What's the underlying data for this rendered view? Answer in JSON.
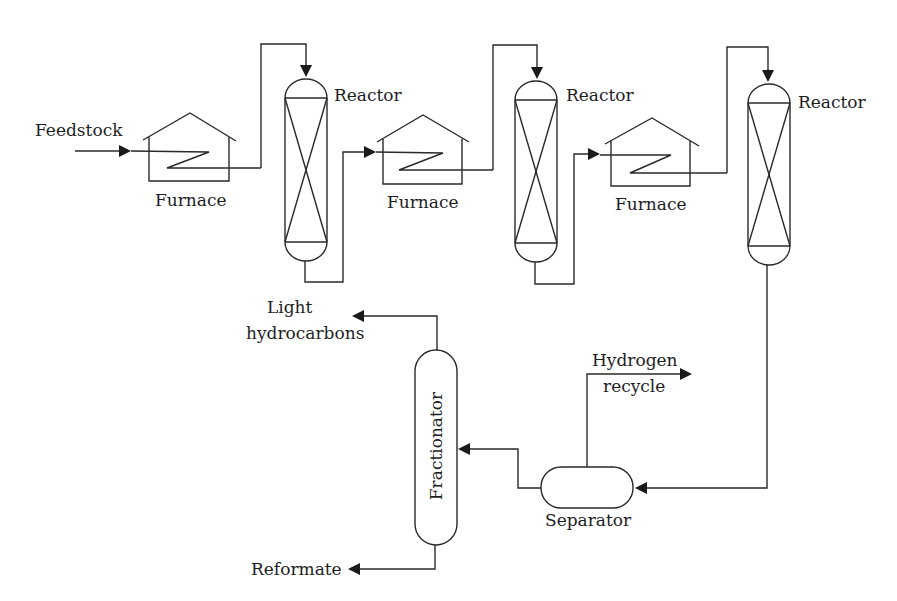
{
  "diagram": {
    "type": "process-flow"
  },
  "labels": {
    "feedstock": "Feedstock",
    "furnace_1": "Furnace",
    "furnace_2": "Furnace",
    "furnace_3": "Furnace",
    "reactor_1": "Reactor",
    "reactor_2": "Reactor",
    "reactor_3": "Reactor",
    "light_hc_line1": "Light",
    "light_hc_line2": "hydrocarbons",
    "hydrogen_line1": "Hydrogen",
    "hydrogen_line2": "recycle",
    "fractionator": "Fractionator",
    "separator": "Separator",
    "reformate": "Reformate"
  },
  "flow": [
    {
      "from": "Feedstock",
      "to": "Furnace 1"
    },
    {
      "from": "Furnace 1",
      "to": "Reactor 1"
    },
    {
      "from": "Reactor 1",
      "to": "Furnace 2"
    },
    {
      "from": "Furnace 2",
      "to": "Reactor 2"
    },
    {
      "from": "Reactor 2",
      "to": "Furnace 3"
    },
    {
      "from": "Furnace 3",
      "to": "Reactor 3"
    },
    {
      "from": "Reactor 3",
      "to": "Separator"
    },
    {
      "from": "Separator",
      "to": "Hydrogen recycle"
    },
    {
      "from": "Separator",
      "to": "Fractionator"
    },
    {
      "from": "Fractionator",
      "to": "Light hydrocarbons"
    },
    {
      "from": "Fractionator",
      "to": "Reformate"
    }
  ],
  "colors": {
    "line": "#2a2a2a",
    "background": "#ffffff",
    "text": "#1e1e1e"
  }
}
